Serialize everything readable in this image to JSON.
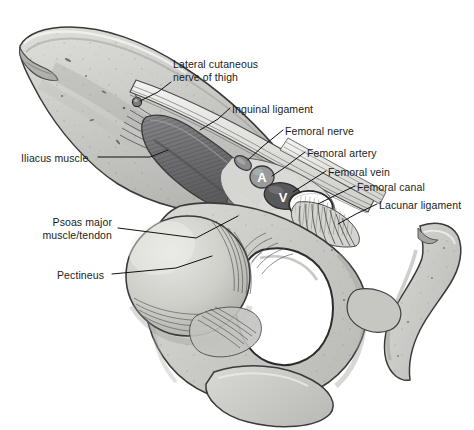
{
  "illustration": {
    "title": "Femoral triangle and inguinal region anatomy",
    "style": "grayscale medical line illustration",
    "background_color": "#ffffff",
    "bone_fill": "#c9c9c6",
    "bone_fill_light": "#d8d8d4",
    "bone_outline": "#3a3a3a",
    "muscle_dark": "#6f6f70",
    "muscle_mid": "#8d8d8d",
    "leader_line_color": "#111111",
    "label_color": "#1b1b1b"
  },
  "labels": [
    {
      "id": "lateral-cutaneous-nerve-of-thigh",
      "line1": "Lateral cutaneous",
      "line2": "nerve of thigh",
      "x": 173,
      "y": 58,
      "align": "left"
    },
    {
      "id": "inguinal-ligament",
      "line1": "Inguinal ligament",
      "line2": "",
      "x": 232,
      "y": 103,
      "align": "left"
    },
    {
      "id": "femoral-nerve",
      "line1": "Femoral nerve",
      "line2": "",
      "x": 285,
      "y": 125,
      "align": "left"
    },
    {
      "id": "femoral-artery",
      "line1": "Femoral artery",
      "line2": "",
      "x": 307,
      "y": 147,
      "align": "left"
    },
    {
      "id": "femoral-vein",
      "line1": "Femoral vein",
      "line2": "",
      "x": 328,
      "y": 166,
      "align": "left"
    },
    {
      "id": "femoral-canal",
      "line1": "Femoral canal",
      "line2": "",
      "x": 357,
      "y": 181,
      "align": "left"
    },
    {
      "id": "lacunar-ligament",
      "line1": "Lacunar ligament",
      "line2": "",
      "x": 379,
      "y": 199,
      "align": "left"
    },
    {
      "id": "iliacus-muscle",
      "line1": "Iliacus muscle",
      "line2": "",
      "x": 21,
      "y": 152,
      "align": "left"
    },
    {
      "id": "psoas-major-muscle-tendon",
      "line1": "Psoas major",
      "line2": "muscle/tendon",
      "x": 55,
      "y": 216,
      "align": "right"
    },
    {
      "id": "pectineus",
      "line1": "Pectineus",
      "line2": "",
      "x": 57,
      "y": 269,
      "align": "left"
    }
  ],
  "vessel_markers": [
    {
      "id": "artery-marker",
      "letter": "A",
      "fill": "#9a9a9a",
      "text_color": "#ffffff",
      "cx": 262,
      "cy": 177,
      "rx": 12,
      "ry": 11
    },
    {
      "id": "vein-marker",
      "letter": "V",
      "fill": "#58585a",
      "text_color": "#ffffff",
      "cx": 283,
      "cy": 196,
      "rx": 19,
      "ry": 13
    }
  ]
}
